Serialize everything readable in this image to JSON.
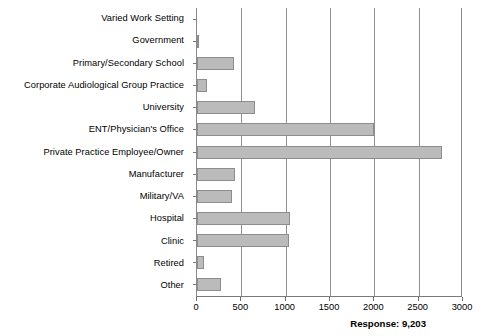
{
  "chart_data": {
    "type": "bar",
    "orientation": "horizontal",
    "title": "",
    "subtitle": "",
    "xlabel": "",
    "ylabel": "",
    "xlim": [
      0,
      3000
    ],
    "xticks": [
      0,
      500,
      1000,
      1500,
      2000,
      2500,
      3000
    ],
    "xtick_labels": [
      "0",
      "500",
      "1000",
      "1500",
      "2000",
      "2500",
      "3000"
    ],
    "grid": "vertical",
    "legend": "none",
    "categories": [
      "Varied Work Setting",
      "Government",
      "Primary/Secondary School",
      "Corporate Audiological Group Practice",
      "University",
      "ENT/Physician's Office",
      "Private Practice Employee/Owner",
      "Manufacturer",
      "Military/VA",
      "Hospital",
      "Clinic",
      "Retired",
      "Other"
    ],
    "values": [
      0,
      20,
      420,
      115,
      650,
      2000,
      2760,
      430,
      390,
      1050,
      1040,
      80,
      270
    ],
    "series": [
      {
        "name": "Responses",
        "values": [
          0,
          20,
          420,
          115,
          650,
          2000,
          2760,
          430,
          390,
          1050,
          1040,
          80,
          270
        ]
      }
    ],
    "annotations": [
      {
        "name": "response-total",
        "text": "Response: 9,203",
        "position": "below-axis-right"
      }
    ],
    "colors": {
      "bar_fill": "#bbbbbb",
      "bar_stroke": "#8d8d8d",
      "gridline": "#8f8f8f",
      "axis": "#7a7a7a",
      "text": "#000000",
      "background": "#ffffff"
    }
  },
  "footer": {
    "response_label": "Response: 9,203"
  }
}
